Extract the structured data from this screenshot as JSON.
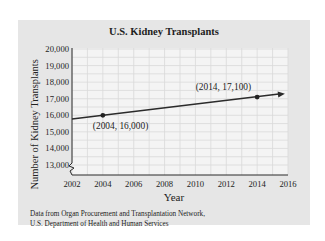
{
  "chart_data": {
    "type": "line",
    "title": "U.S. Kidney Transplants",
    "xlabel": "Year",
    "ylabel": "Number of Kidney Transplants",
    "x_ticks": [
      "2002",
      "2004",
      "2006",
      "2008",
      "2010",
      "2012",
      "2014",
      "2016"
    ],
    "y_ticks": [
      "13,000",
      "14,000",
      "15,000",
      "16,000",
      "17,000",
      "18,000",
      "19,000",
      "20,000"
    ],
    "xlim": [
      2002,
      2016
    ],
    "ylim": [
      13000,
      20000
    ],
    "y_axis_break": true,
    "grid": true,
    "series": [
      {
        "name": "Kidney transplants trend",
        "x": [
          2004,
          2014
        ],
        "y": [
          16000,
          17100
        ],
        "marked_points": [
          {
            "x": 2004,
            "y": 16000,
            "label": "(2004, 16,000)"
          },
          {
            "x": 2014,
            "y": 17100,
            "label": "(2014, 17,100)"
          }
        ],
        "extends_with_arrow": true
      }
    ],
    "colors": {
      "panel": "#e6e6e6",
      "plot_bg": "#f4f4f4",
      "grid": "#d9d9d9",
      "line": "#2b2b2b"
    }
  },
  "source_note": {
    "line1": "Data from Organ Procurement and Transplantation Network,",
    "line2": "U.S. Department of Health and Human Services"
  }
}
